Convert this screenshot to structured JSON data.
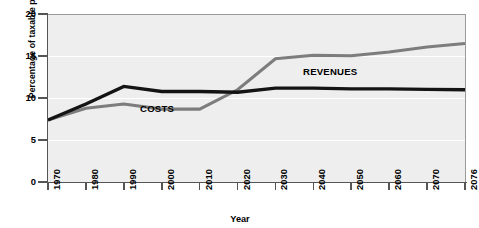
{
  "chart_data": {
    "type": "line",
    "title": "",
    "xlabel": "Year",
    "ylabel": "Percentage of taxable payroll",
    "xlim": [
      1970,
      2076
    ],
    "ylim": [
      0,
      20
    ],
    "grid": true,
    "legend_position": "inline-annotations",
    "yticks": [
      "0",
      "5",
      "10",
      "15",
      "20"
    ],
    "ytick_values": [
      0,
      5,
      10,
      15,
      20
    ],
    "xticks": [
      "1970",
      "1980",
      "1990",
      "2000",
      "2010",
      "2020",
      "2030",
      "2040",
      "2050",
      "2060",
      "2070",
      "2076"
    ],
    "xtick_values": [
      1970,
      1980,
      1990,
      2000,
      2010,
      2020,
      2030,
      2040,
      2050,
      2060,
      2070,
      2076
    ],
    "series": [
      {
        "name": "REVENUES",
        "color": "#141414",
        "x": [
          1970,
          1980,
          1990,
          2000,
          2010,
          2020,
          2030,
          2040,
          2050,
          2060,
          2070,
          2076
        ],
        "values": [
          7.5,
          9.4,
          11.5,
          10.9,
          10.9,
          10.8,
          11.3,
          11.3,
          11.2,
          11.2,
          11.15,
          11.1
        ]
      },
      {
        "name": "COSTS",
        "color": "#7d7d7d",
        "x": [
          1970,
          1980,
          1990,
          2000,
          2010,
          2020,
          2030,
          2040,
          2050,
          2060,
          2070,
          2076
        ],
        "values": [
          7.5,
          8.9,
          9.4,
          8.8,
          8.8,
          11.1,
          14.8,
          15.2,
          15.15,
          15.6,
          16.2,
          16.6
        ]
      }
    ],
    "annotations": [
      {
        "text": "COSTS",
        "series": "COSTS"
      },
      {
        "text": "REVENUES",
        "series": "REVENUES"
      }
    ],
    "colors": {
      "plot_background": "#eeeeee",
      "gridline": "#ffffff",
      "axis": "#555555",
      "costs_line": "#7d7d7d",
      "revenues_line": "#141414"
    }
  }
}
